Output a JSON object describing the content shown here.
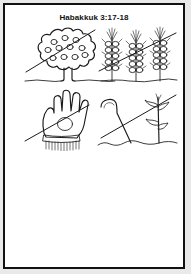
{
  "page": {
    "title": "Habakkuk 3:17-18",
    "background_color": "#ffffff",
    "border_color": "#111111",
    "ink_color": "#1a1a1a",
    "outer_margin_color": "#e9e9e9"
  },
  "worksheet": {
    "kind": "coloring-worksheet",
    "panel_count": 4,
    "panels": [
      {
        "id": "fig-tree",
        "position": "top-left",
        "label": "Fig tree with fruit",
        "crossed_out": true,
        "detail": "round scalloped canopy with 11 fruits, short trunk, ground line"
      },
      {
        "id": "grain-stalks",
        "position": "top-right",
        "label": "Three stalks of grain",
        "crossed_out": true,
        "detail": "three heads of wheat with stacked kernels and awns, ground line"
      },
      {
        "id": "empty-hand",
        "position": "bottom-left",
        "label": "Open hand / glove",
        "crossed_out": true,
        "detail": "open palm with four fingers and thumb, fringed cuff"
      },
      {
        "id": "shepherds-crook",
        "position": "bottom-right",
        "label": "Shepherd's crook and vine",
        "crossed_out": true,
        "detail": "curved staff leaning against a tall leafy stalk, ground line"
      }
    ],
    "blank_section": {
      "label": "blank writing area"
    }
  }
}
